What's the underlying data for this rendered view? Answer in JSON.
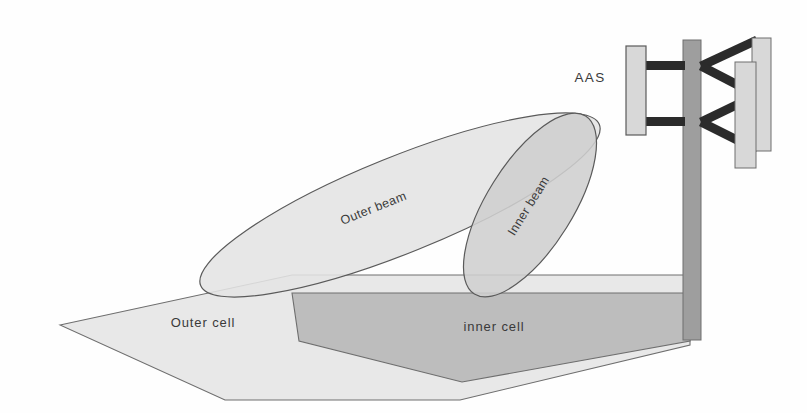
{
  "figure": {
    "canvas": {
      "width": 807,
      "height": 413
    },
    "background_color": "#fefefe"
  },
  "labels": {
    "aas": "AAS",
    "outer_beam": "Outer beam",
    "inner_beam": "Inner beam",
    "outer_cell": "Outer cell",
    "inner_cell": "inner cell"
  },
  "colors": {
    "outline": "#5a5a5a",
    "outer_beam_fill": "#e4e4e4",
    "inner_beam_fill": "#cfcfcf",
    "outer_cell_fill": "#e8e8e8",
    "inner_cell_fill": "#bdbdbd",
    "panel_fill": "#d8d8d8",
    "mast_fill": "#9e9e9e",
    "strut_fill": "#2b2b2b",
    "label_color": "#3a3a3a"
  },
  "geometry": {
    "outer_beam": {
      "center_x": 400,
      "center_y": 205,
      "radius_x": 215,
      "radius_y": 48,
      "rotation_deg": -22
    },
    "inner_beam": {
      "center_x": 530,
      "center_y": 205,
      "radius_x": 105,
      "radius_y": 43,
      "rotation_deg": -58
    },
    "outer_cell_points": "60,325 292,275 690,275 690,345 460,400 225,400",
    "inner_cell_points": "292,293 690,293 690,341 462,382 299,341",
    "aas_panel": {
      "x": 626,
      "y": 46,
      "width": 20,
      "height": 89
    },
    "mast": {
      "x": 683,
      "y": 40,
      "width": 18,
      "height": 300
    },
    "right_panel_outer": {
      "x": 752,
      "y": 38,
      "width": 19,
      "height": 113
    },
    "right_panel_inner": {
      "x": 735,
      "y": 62,
      "width": 21,
      "height": 106
    },
    "struts": [
      {
        "x": 646,
        "y": 61,
        "width": 38,
        "height": 9
      },
      {
        "x": 646,
        "y": 117,
        "width": 38,
        "height": 9
      }
    ],
    "braces": [
      {
        "x1": 701,
        "y1": 66,
        "x2": 757,
        "y2": 40
      },
      {
        "x1": 701,
        "y1": 66,
        "x2": 757,
        "y2": 95
      },
      {
        "x1": 701,
        "y1": 122,
        "x2": 757,
        "y2": 95
      },
      {
        "x1": 701,
        "y1": 122,
        "x2": 757,
        "y2": 150
      }
    ]
  }
}
